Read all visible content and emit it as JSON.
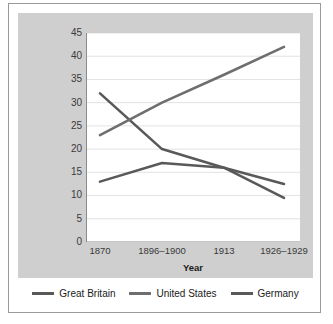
{
  "chart_data": {
    "type": "line",
    "title": "",
    "xlabel": "Year",
    "ylabel": "Percentage of World's Industrial Production",
    "categories": [
      "1870",
      "1896–1900",
      "1913",
      "1926–1929"
    ],
    "ylim": [
      0,
      45
    ],
    "yticks": [
      0,
      5,
      10,
      15,
      20,
      25,
      30,
      35,
      40,
      45
    ],
    "ytick_labels": [
      "0",
      "5",
      "10",
      "15",
      "20",
      "25",
      "30",
      "35",
      "40",
      "45"
    ],
    "grid": true,
    "legend_position": "bottom",
    "series": [
      {
        "name": "Great Britain",
        "color": "#595959",
        "values": [
          32,
          20,
          16,
          9.5
        ]
      },
      {
        "name": "United States",
        "color": "#6e6e6e",
        "values": [
          23,
          30,
          36,
          42
        ]
      },
      {
        "name": "Germany",
        "color": "#595959",
        "values": [
          13,
          17,
          16,
          12.5
        ]
      }
    ]
  },
  "colors": {
    "panel_background": "#cfcfcf",
    "plot_background": "#ffffff",
    "gridline": "#e2e2e2",
    "axis": "#8c8c8c",
    "figure_border": "#9a9a9a",
    "text": "#1a1a1a"
  }
}
